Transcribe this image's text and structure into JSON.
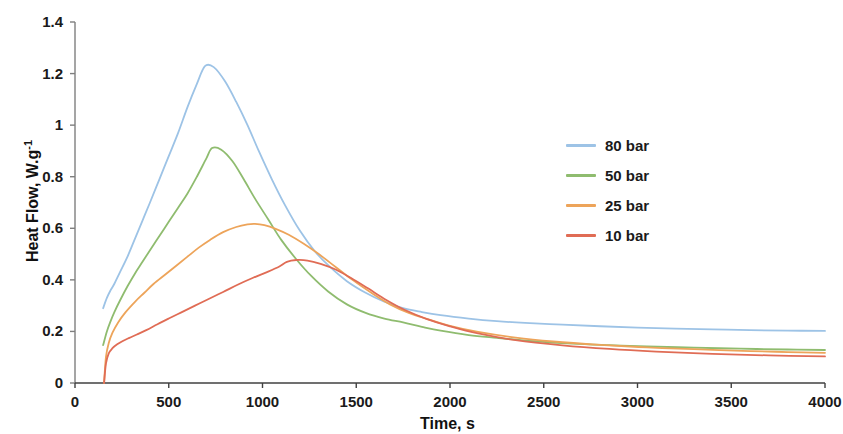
{
  "chart_data": {
    "type": "line",
    "title": "",
    "xlabel": "Time, s",
    "ylabel": "Heat Flow, W.g-1",
    "ylabel_base": "Heat Flow, W.g",
    "ylabel_exponent": "-1",
    "xlim": [
      0,
      4000
    ],
    "ylim": [
      0,
      1.4
    ],
    "xticks": [
      0,
      500,
      1000,
      1500,
      2000,
      2500,
      3000,
      3500,
      4000
    ],
    "xtick_labels": [
      "0",
      "500",
      "1000",
      "1500",
      "2000",
      "2500",
      "3000",
      "3500",
      "4000"
    ],
    "yticks": [
      0,
      0.2,
      0.4,
      0.6,
      0.8,
      1,
      1.2,
      1.4
    ],
    "ytick_labels": [
      "0",
      "0.2",
      "0.4",
      "0.6",
      "0.8",
      "1",
      "1.2",
      "1.4"
    ],
    "grid": false,
    "legend_position": "center-right",
    "series": [
      {
        "name": "80 bar",
        "color": "#9dc3e6",
        "peak_time": 693,
        "peak_value": 1.23,
        "x": [
          150,
          170,
          190,
          210,
          240,
          280,
          320,
          360,
          400,
          450,
          500,
          550,
          600,
          650,
          693,
          740,
          800,
          860,
          920,
          980,
          1050,
          1120,
          1200,
          1280,
          1360,
          1450,
          1550,
          1650,
          1750,
          1850,
          1950,
          2100,
          2250,
          2400,
          2600,
          2800,
          3000,
          3200,
          3400,
          3600,
          3800,
          4000
        ],
        "y": [
          0.29,
          0.33,
          0.36,
          0.385,
          0.43,
          0.49,
          0.56,
          0.63,
          0.7,
          0.79,
          0.88,
          0.97,
          1.07,
          1.16,
          1.229,
          1.225,
          1.17,
          1.09,
          1.0,
          0.9,
          0.79,
          0.69,
          0.59,
          0.51,
          0.45,
          0.395,
          0.35,
          0.315,
          0.29,
          0.275,
          0.263,
          0.25,
          0.24,
          0.233,
          0.226,
          0.22,
          0.215,
          0.211,
          0.208,
          0.205,
          0.203,
          0.202
        ]
      },
      {
        "name": "50 bar",
        "color": "#8fbc6f",
        "peak_time": 731,
        "peak_value": 0.91,
        "x": [
          150,
          170,
          190,
          210,
          240,
          280,
          320,
          360,
          400,
          450,
          500,
          550,
          600,
          650,
          700,
          731,
          780,
          840,
          900,
          960,
          1030,
          1100,
          1180,
          1260,
          1350,
          1450,
          1550,
          1650,
          1750,
          1850,
          1950,
          2100,
          2250,
          2450,
          2650,
          2850,
          3050,
          3300,
          3550,
          3800,
          4000
        ],
        "y": [
          0.147,
          0.2,
          0.24,
          0.275,
          0.32,
          0.375,
          0.425,
          0.47,
          0.515,
          0.57,
          0.625,
          0.68,
          0.735,
          0.8,
          0.87,
          0.911,
          0.905,
          0.86,
          0.79,
          0.715,
          0.635,
          0.555,
          0.48,
          0.415,
          0.355,
          0.305,
          0.272,
          0.25,
          0.235,
          0.218,
          0.203,
          0.186,
          0.175,
          0.162,
          0.153,
          0.147,
          0.142,
          0.137,
          0.133,
          0.13,
          0.128
        ]
      },
      {
        "name": "25 bar",
        "color": "#eda45a",
        "peak_time": 960,
        "peak_value": 0.617,
        "x": [
          155,
          165,
          180,
          200,
          230,
          270,
          320,
          370,
          420,
          480,
          540,
          600,
          660,
          720,
          790,
          860,
          920,
          960,
          1010,
          1070,
          1140,
          1220,
          1300,
          1390,
          1480,
          1580,
          1680,
          1780,
          1880,
          2000,
          2150,
          2350,
          2550,
          2800,
          3050,
          3300,
          3600,
          3800,
          4000
        ],
        "y": [
          0.0,
          0.1,
          0.155,
          0.195,
          0.235,
          0.275,
          0.315,
          0.35,
          0.385,
          0.42,
          0.455,
          0.49,
          0.525,
          0.555,
          0.585,
          0.605,
          0.615,
          0.617,
          0.612,
          0.598,
          0.575,
          0.54,
          0.5,
          0.45,
          0.4,
          0.35,
          0.305,
          0.272,
          0.248,
          0.222,
          0.198,
          0.176,
          0.161,
          0.148,
          0.138,
          0.131,
          0.124,
          0.12,
          0.117
        ]
      },
      {
        "name": "10 bar",
        "color": "#e06c55",
        "peak_time": 1130,
        "peak_value": 0.477,
        "x": [
          155,
          165,
          180,
          200,
          225,
          255,
          290,
          330,
          380,
          440,
          500,
          570,
          640,
          710,
          790,
          870,
          950,
          1030,
          1090,
          1130,
          1180,
          1240,
          1310,
          1390,
          1470,
          1560,
          1660,
          1760,
          1870,
          2000,
          2150,
          2350,
          2600,
          2850,
          3100,
          3400,
          3700,
          4000
        ],
        "y": [
          0.0,
          0.075,
          0.115,
          0.135,
          0.15,
          0.163,
          0.175,
          0.188,
          0.205,
          0.228,
          0.25,
          0.275,
          0.3,
          0.325,
          0.353,
          0.382,
          0.408,
          0.432,
          0.452,
          0.47,
          0.477,
          0.475,
          0.462,
          0.44,
          0.408,
          0.368,
          0.322,
          0.283,
          0.25,
          0.22,
          0.192,
          0.166,
          0.146,
          0.132,
          0.122,
          0.113,
          0.107,
          0.103
        ]
      }
    ]
  },
  "axis": {
    "axis_color": "#7f7f7f",
    "tick_color": "#7f7f7f"
  }
}
